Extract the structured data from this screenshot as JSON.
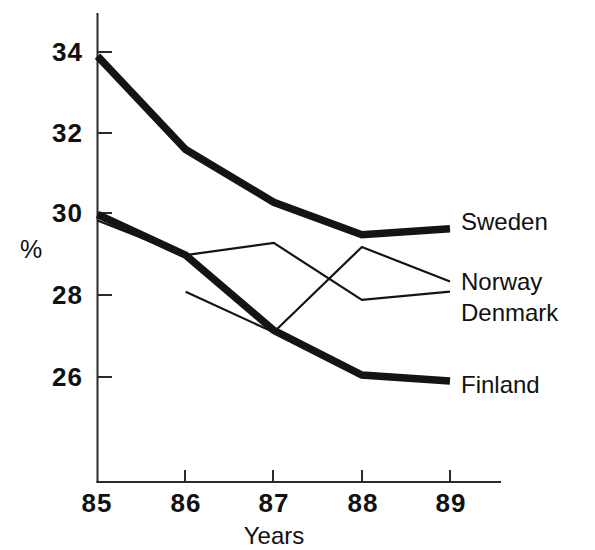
{
  "chart_data": {
    "type": "line",
    "title": "",
    "xlabel": "Years",
    "ylabel": "%",
    "x": [
      "85",
      "86",
      "87",
      "88",
      "89"
    ],
    "categories": [
      "85",
      "86",
      "87",
      "88",
      "89"
    ],
    "xlim": [
      85,
      89
    ],
    "ylim": [
      24.4,
      34.8
    ],
    "yticks": [
      26,
      28,
      30,
      32,
      34
    ],
    "ytick_labels": [
      "26",
      "28",
      "30",
      "32",
      "34"
    ],
    "xtick_labels": [
      "85",
      "86",
      "87",
      "88",
      "89"
    ],
    "grid": false,
    "legend_position": "right-inline",
    "series": [
      {
        "name": "Sweden",
        "style": "thick",
        "x": [
          "85",
          "86",
          "87",
          "88",
          "89"
        ],
        "values": [
          33.9,
          31.6,
          30.3,
          29.5,
          29.65
        ]
      },
      {
        "name": "Norway",
        "style": "thin",
        "x": [
          "85",
          "86",
          "87",
          "88",
          "89"
        ],
        "values": [
          29.85,
          29.0,
          29.3,
          27.9,
          28.1
        ]
      },
      {
        "name": "Denmark",
        "style": "thin",
        "x": [
          "86",
          "87",
          "88",
          "89"
        ],
        "values": [
          28.1,
          27.1,
          29.2,
          28.35
        ]
      },
      {
        "name": "Finland",
        "style": "thick",
        "x": [
          "85",
          "86",
          "87",
          "88",
          "89"
        ],
        "values": [
          30.0,
          29.0,
          27.15,
          26.05,
          25.9
        ]
      }
    ]
  },
  "labels": {
    "y_unit": "%",
    "x_axis_title": "Years",
    "y_tick_34": "34",
    "y_tick_32": "32",
    "y_tick_30": "30",
    "y_tick_28": "28",
    "y_tick_26": "26",
    "x_tick_85": "85",
    "x_tick_86": "86",
    "x_tick_87": "87",
    "x_tick_88": "88",
    "x_tick_89": "89",
    "series_sweden": "Sweden",
    "series_norway": "Norway",
    "series_denmark": "Denmark",
    "series_finland": "Finland"
  },
  "colors": {
    "line": "#141414",
    "axis": "#2a2a2a",
    "text": "#111111",
    "background": "#ffffff"
  }
}
